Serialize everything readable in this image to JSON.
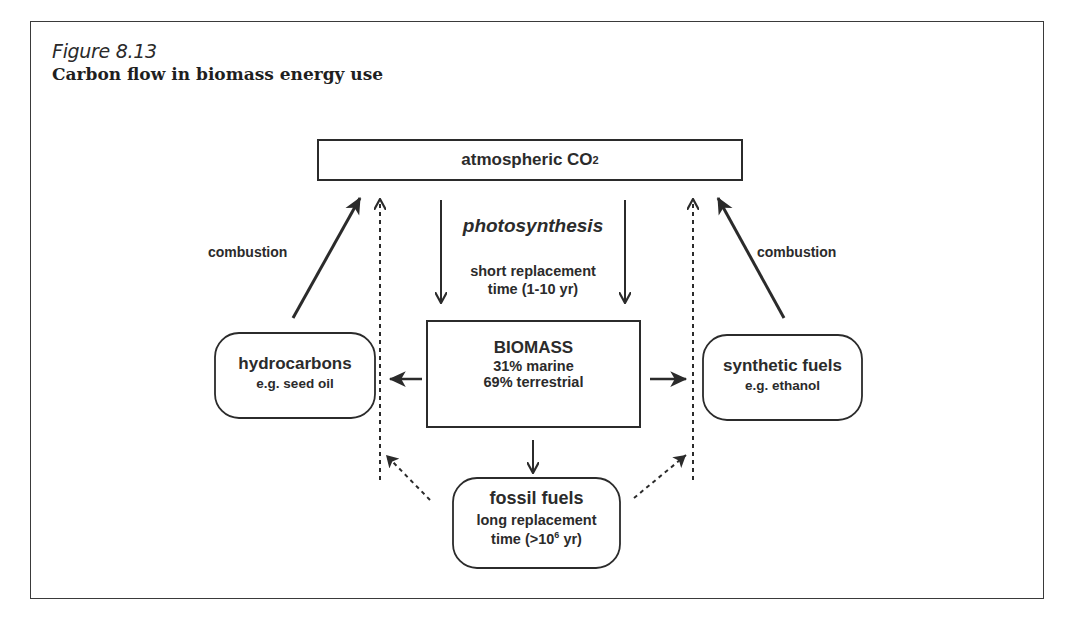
{
  "figure": {
    "label": "Figure 8.13",
    "title": "Carbon flow in biomass energy use"
  },
  "nodes": {
    "atmosphere": {
      "text": "atmospheric CO",
      "subscript": "2"
    },
    "biomass": {
      "title": "BIOMASS",
      "line1": "31% marine",
      "line2": "69% terrestrial"
    },
    "hydrocarbons": {
      "title": "hydrocarbons",
      "example": "e.g. seed oil"
    },
    "synthetic_fuels": {
      "title": "synthetic fuels",
      "example": "e.g. ethanol"
    },
    "fossil_fuels": {
      "title": "fossil fuels",
      "line1": "long replacement",
      "line2_prefix": "time (>10",
      "line2_sup": "6",
      "line2_suffix": " yr)"
    }
  },
  "edges": {
    "photosynthesis": {
      "label": "photosynthesis",
      "note_line1": "short replacement",
      "note_line2": "time (1-10 yr)"
    },
    "combustion_left": {
      "label": "combustion"
    },
    "combustion_right": {
      "label": "combustion"
    }
  },
  "colors": {
    "ink": "#2b2b2b",
    "frame": "#3a3a3a",
    "background": "#ffffff"
  }
}
